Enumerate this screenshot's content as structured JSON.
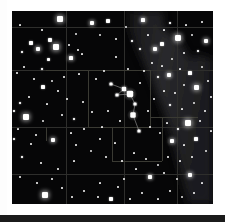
{
  "image": {
    "kind": "star-chart",
    "description": "Astronomical sky chart plate: dark star field with coordinate grid, constellation boundary lines, Milky Way band and a constellation stick figure",
    "plate": {
      "x": 12,
      "y": 11,
      "width": 201,
      "height": 193
    },
    "colors": {
      "page_background": "#ffffff",
      "sky_background": "#060607",
      "star": "#ffffff",
      "grid_line": "#2e2e2c",
      "boundary_line": "#3a3a33",
      "milky_way": "#27272a",
      "constellation_line": "#8d8d8d",
      "bottom_strip": "#1b1b1b"
    }
  },
  "chart_data": {
    "type": "scatter",
    "title": "",
    "xlabel": "",
    "ylabel": "",
    "xlim": [
      0,
      201
    ],
    "ylim": [
      0,
      193
    ],
    "grid": true,
    "legend": null,
    "grid_lines": {
      "horizontal_y": [
        16,
        59,
        116,
        163
      ],
      "vertical_x": [
        54,
        112,
        165
      ]
    },
    "boundary_segments": [
      {
        "x1": 76,
        "y1": 59,
        "x2": 76,
        "y2": 116
      },
      {
        "x1": 76,
        "y1": 59,
        "x2": 138,
        "y2": 59
      },
      {
        "x1": 138,
        "y1": 59,
        "x2": 138,
        "y2": 116
      },
      {
        "x1": 76,
        "y1": 116,
        "x2": 138,
        "y2": 116
      },
      {
        "x1": 100,
        "y1": 116,
        "x2": 100,
        "y2": 150
      },
      {
        "x1": 100,
        "y1": 150,
        "x2": 150,
        "y2": 150
      },
      {
        "x1": 150,
        "y1": 106,
        "x2": 150,
        "y2": 150
      },
      {
        "x1": 138,
        "y1": 106,
        "x2": 186,
        "y2": 106
      },
      {
        "x1": 34,
        "y1": 59,
        "x2": 76,
        "y2": 59
      },
      {
        "x1": 34,
        "y1": 116,
        "x2": 34,
        "y2": 130
      },
      {
        "x1": 100,
        "y1": 130,
        "x2": 100,
        "y2": 150
      }
    ],
    "milkyway_band": {
      "label": "Milky Way",
      "polygon": [
        [
          118,
          0
        ],
        [
          150,
          0
        ],
        [
          152,
          18
        ],
        [
          168,
          30
        ],
        [
          178,
          48
        ],
        [
          186,
          44
        ],
        [
          201,
          48
        ],
        [
          201,
          193
        ],
        [
          176,
          193
        ],
        [
          168,
          160
        ],
        [
          158,
          120
        ],
        [
          150,
          96
        ],
        [
          140,
          70
        ],
        [
          128,
          44
        ],
        [
          118,
          20
        ]
      ]
    },
    "constellation_figure": {
      "name": "",
      "nodes": [
        {
          "x": 99,
          "y": 73,
          "mag": 3.4
        },
        {
          "x": 112,
          "y": 78,
          "mag": 2.8
        },
        {
          "x": 105,
          "y": 84,
          "mag": 3.2
        },
        {
          "x": 118,
          "y": 83,
          "mag": 2.2
        },
        {
          "x": 123,
          "y": 93,
          "mag": 3.6
        },
        {
          "x": 121,
          "y": 104,
          "mag": 2.5
        },
        {
          "x": 127,
          "y": 120,
          "mag": 3.9
        }
      ],
      "links": [
        [
          0,
          1
        ],
        [
          1,
          2
        ],
        [
          2,
          3
        ],
        [
          1,
          3
        ],
        [
          3,
          4
        ],
        [
          4,
          5
        ],
        [
          5,
          6
        ]
      ]
    },
    "stars": [
      {
        "x": 8,
        "y": 14,
        "r": 1.1
      },
      {
        "x": 30,
        "y": 19,
        "r": 1.0
      },
      {
        "x": 48,
        "y": 8,
        "r": 2.6
      },
      {
        "x": 64,
        "y": 23,
        "r": 1.2
      },
      {
        "x": 19,
        "y": 32,
        "r": 1.6
      },
      {
        "x": 38,
        "y": 29,
        "r": 1.8
      },
      {
        "x": 10,
        "y": 41,
        "r": 1.3
      },
      {
        "x": 26,
        "y": 38,
        "r": 2.4
      },
      {
        "x": 44,
        "y": 36,
        "r": 2.7
      },
      {
        "x": 36,
        "y": 48,
        "r": 1.5
      },
      {
        "x": 57,
        "y": 34,
        "r": 1.0
      },
      {
        "x": 66,
        "y": 39,
        "r": 0.9
      },
      {
        "x": 70,
        "y": 43,
        "r": 1.1
      },
      {
        "x": 59,
        "y": 47,
        "r": 2.1
      },
      {
        "x": 12,
        "y": 56,
        "r": 1.0
      },
      {
        "x": 30,
        "y": 58,
        "r": 1.3
      },
      {
        "x": 5,
        "y": 62,
        "r": 0.9
      },
      {
        "x": 22,
        "y": 68,
        "r": 1.0
      },
      {
        "x": 40,
        "y": 70,
        "r": 1.2
      },
      {
        "x": 31,
        "y": 76,
        "r": 1.6
      },
      {
        "x": 52,
        "y": 66,
        "r": 0.9
      },
      {
        "x": 67,
        "y": 63,
        "r": 1.1
      },
      {
        "x": 46,
        "y": 80,
        "r": 0.8
      },
      {
        "x": 17,
        "y": 86,
        "r": 1.0
      },
      {
        "x": 8,
        "y": 92,
        "r": 1.4
      },
      {
        "x": 35,
        "y": 93,
        "r": 1.1
      },
      {
        "x": 55,
        "y": 88,
        "r": 0.9
      },
      {
        "x": 71,
        "y": 91,
        "r": 1.0
      },
      {
        "x": 14,
        "y": 106,
        "r": 2.6
      },
      {
        "x": 31,
        "y": 110,
        "r": 1.2
      },
      {
        "x": 50,
        "y": 104,
        "r": 1.0
      },
      {
        "x": 62,
        "y": 108,
        "r": 1.3
      },
      {
        "x": 80,
        "y": 101,
        "r": 1.0
      },
      {
        "x": 6,
        "y": 118,
        "r": 1.1
      },
      {
        "x": 24,
        "y": 124,
        "r": 1.0
      },
      {
        "x": 19,
        "y": 133,
        "r": 0.9
      },
      {
        "x": 41,
        "y": 129,
        "r": 2.3
      },
      {
        "x": 59,
        "y": 122,
        "r": 1.1
      },
      {
        "x": 64,
        "y": 134,
        "r": 0.9
      },
      {
        "x": 88,
        "y": 128,
        "r": 1.0
      },
      {
        "x": 79,
        "y": 140,
        "r": 1.2
      },
      {
        "x": 103,
        "y": 132,
        "r": 1.1
      },
      {
        "x": 10,
        "y": 146,
        "r": 1.3
      },
      {
        "x": 29,
        "y": 152,
        "r": 0.9
      },
      {
        "x": 46,
        "y": 158,
        "r": 1.0
      },
      {
        "x": 62,
        "y": 150,
        "r": 1.1
      },
      {
        "x": 8,
        "y": 166,
        "r": 1.0
      },
      {
        "x": 25,
        "y": 172,
        "r": 0.9
      },
      {
        "x": 40,
        "y": 168,
        "r": 1.0
      },
      {
        "x": 50,
        "y": 177,
        "r": 0.8
      },
      {
        "x": 33,
        "y": 184,
        "r": 2.6
      },
      {
        "x": 60,
        "y": 186,
        "r": 0.9
      },
      {
        "x": 72,
        "y": 180,
        "r": 1.0
      },
      {
        "x": 88,
        "y": 172,
        "r": 1.1
      },
      {
        "x": 86,
        "y": 186,
        "r": 1.0
      },
      {
        "x": 99,
        "y": 188,
        "r": 1.6
      },
      {
        "x": 106,
        "y": 176,
        "r": 1.0
      },
      {
        "x": 80,
        "y": 12,
        "r": 2.3
      },
      {
        "x": 96,
        "y": 10,
        "r": 1.6
      },
      {
        "x": 88,
        "y": 24,
        "r": 1.2
      },
      {
        "x": 104,
        "y": 28,
        "r": 1.0
      },
      {
        "x": 114,
        "y": 16,
        "r": 1.2
      },
      {
        "x": 120,
        "y": 30,
        "r": 1.4
      },
      {
        "x": 131,
        "y": 9,
        "r": 2.1
      },
      {
        "x": 136,
        "y": 24,
        "r": 1.1
      },
      {
        "x": 128,
        "y": 38,
        "r": 1.3
      },
      {
        "x": 143,
        "y": 38,
        "r": 2.3
      },
      {
        "x": 152,
        "y": 19,
        "r": 1.1
      },
      {
        "x": 150,
        "y": 33,
        "r": 1.6
      },
      {
        "x": 158,
        "y": 12,
        "r": 1.3
      },
      {
        "x": 166,
        "y": 27,
        "r": 2.9
      },
      {
        "x": 174,
        "y": 14,
        "r": 1.1
      },
      {
        "x": 180,
        "y": 24,
        "r": 1.2
      },
      {
        "x": 190,
        "y": 11,
        "r": 1.0
      },
      {
        "x": 194,
        "y": 30,
        "r": 2.4
      },
      {
        "x": 186,
        "y": 40,
        "r": 1.4
      },
      {
        "x": 172,
        "y": 42,
        "r": 1.0
      },
      {
        "x": 160,
        "y": 48,
        "r": 1.2
      },
      {
        "x": 150,
        "y": 55,
        "r": 1.1
      },
      {
        "x": 140,
        "y": 52,
        "r": 0.9
      },
      {
        "x": 132,
        "y": 60,
        "r": 1.0
      },
      {
        "x": 146,
        "y": 66,
        "r": 1.3
      },
      {
        "x": 157,
        "y": 64,
        "r": 2.2
      },
      {
        "x": 168,
        "y": 58,
        "r": 1.1
      },
      {
        "x": 178,
        "y": 62,
        "r": 1.7
      },
      {
        "x": 190,
        "y": 56,
        "r": 1.2
      },
      {
        "x": 196,
        "y": 70,
        "r": 1.0
      },
      {
        "x": 184,
        "y": 76,
        "r": 2.5
      },
      {
        "x": 172,
        "y": 74,
        "r": 1.2
      },
      {
        "x": 163,
        "y": 82,
        "r": 1.0
      },
      {
        "x": 152,
        "y": 80,
        "r": 1.1
      },
      {
        "x": 142,
        "y": 88,
        "r": 1.0
      },
      {
        "x": 158,
        "y": 94,
        "r": 1.3
      },
      {
        "x": 170,
        "y": 98,
        "r": 1.1
      },
      {
        "x": 182,
        "y": 92,
        "r": 1.2
      },
      {
        "x": 193,
        "y": 100,
        "r": 1.0
      },
      {
        "x": 188,
        "y": 110,
        "r": 1.0
      },
      {
        "x": 176,
        "y": 112,
        "r": 2.8
      },
      {
        "x": 166,
        "y": 118,
        "r": 1.4
      },
      {
        "x": 155,
        "y": 112,
        "r": 1.1
      },
      {
        "x": 148,
        "y": 122,
        "r": 1.2
      },
      {
        "x": 138,
        "y": 116,
        "r": 1.0
      },
      {
        "x": 160,
        "y": 130,
        "r": 2.2
      },
      {
        "x": 172,
        "y": 134,
        "r": 1.1
      },
      {
        "x": 184,
        "y": 128,
        "r": 1.6
      },
      {
        "x": 194,
        "y": 140,
        "r": 1.2
      },
      {
        "x": 180,
        "y": 146,
        "r": 1.0
      },
      {
        "x": 168,
        "y": 150,
        "r": 1.1
      },
      {
        "x": 156,
        "y": 146,
        "r": 0.9
      },
      {
        "x": 146,
        "y": 154,
        "r": 1.2
      },
      {
        "x": 134,
        "y": 148,
        "r": 1.0
      },
      {
        "x": 124,
        "y": 158,
        "r": 1.1
      },
      {
        "x": 138,
        "y": 166,
        "r": 2.0
      },
      {
        "x": 152,
        "y": 162,
        "r": 1.0
      },
      {
        "x": 165,
        "y": 168,
        "r": 1.2
      },
      {
        "x": 178,
        "y": 164,
        "r": 2.4
      },
      {
        "x": 190,
        "y": 172,
        "r": 1.1
      },
      {
        "x": 182,
        "y": 182,
        "r": 1.0
      },
      {
        "x": 170,
        "y": 186,
        "r": 1.2
      },
      {
        "x": 158,
        "y": 180,
        "r": 1.0
      },
      {
        "x": 146,
        "y": 188,
        "r": 1.1
      },
      {
        "x": 130,
        "y": 182,
        "r": 1.0
      },
      {
        "x": 118,
        "y": 188,
        "r": 0.9
      },
      {
        "x": 112,
        "y": 168,
        "r": 1.0
      },
      {
        "x": 122,
        "y": 142,
        "r": 1.1
      },
      {
        "x": 110,
        "y": 150,
        "r": 0.9
      },
      {
        "x": 94,
        "y": 146,
        "r": 1.0
      },
      {
        "x": 92,
        "y": 60,
        "r": 1.0
      },
      {
        "x": 84,
        "y": 68,
        "r": 0.9
      },
      {
        "x": 96,
        "y": 100,
        "r": 1.0
      },
      {
        "x": 108,
        "y": 110,
        "r": 0.9
      },
      {
        "x": 90,
        "y": 116,
        "r": 1.1
      },
      {
        "x": 136,
        "y": 100,
        "r": 1.0
      },
      {
        "x": 128,
        "y": 72,
        "r": 0.9
      },
      {
        "x": 116,
        "y": 58,
        "r": 1.0
      },
      {
        "x": 104,
        "y": 46,
        "r": 0.8
      },
      {
        "x": 72,
        "y": 118,
        "r": 1.0
      },
      {
        "x": 199,
        "y": 86,
        "r": 1.0
      },
      {
        "x": 199,
        "y": 120,
        "r": 1.1
      },
      {
        "x": 2,
        "y": 100,
        "r": 1.3
      },
      {
        "x": 2,
        "y": 128,
        "r": 1.4
      }
    ]
  }
}
